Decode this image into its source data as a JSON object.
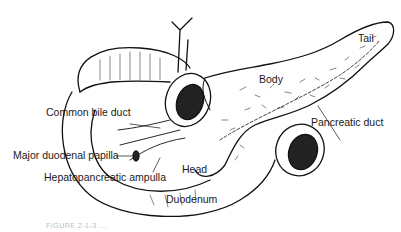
{
  "figure": {
    "labels": {
      "tail": "Tail",
      "body": "Body",
      "common_bile_duct": "Common bile duct",
      "pancreatic_duct": "Pancreatic duct",
      "major_duodenal_papilla": "Major duodenal papilla",
      "hepatopancreatic_ampulla": "Hepatopancreatic ampulla",
      "head": "Head",
      "duodenum": "Duodenum"
    },
    "caption": "FIGURE 2-1-3 ..."
  }
}
